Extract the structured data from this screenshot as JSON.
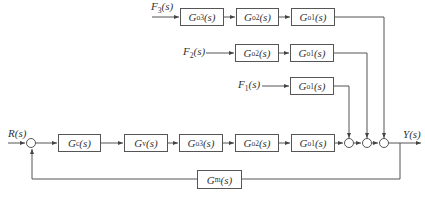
{
  "diagram": {
    "type": "control-block-diagram",
    "inputs": {
      "reference": "R(s)",
      "disturbances": [
        {
          "id": "F3",
          "label": "F3(s)"
        },
        {
          "id": "F2",
          "label": "F2(s)"
        },
        {
          "id": "F1",
          "label": "F1(s)"
        }
      ]
    },
    "output": "Y(s)",
    "blocks": {
      "row_f3": [
        {
          "base": "G",
          "sub": "o3",
          "tail": "(s)"
        },
        {
          "base": "G",
          "sub": "o2",
          "tail": "(s)"
        },
        {
          "base": "G",
          "sub": "o1",
          "tail": "(s)"
        }
      ],
      "row_f2": [
        {
          "base": "G",
          "sub": "o2",
          "tail": "(s)"
        },
        {
          "base": "G",
          "sub": "o1",
          "tail": "(s)"
        }
      ],
      "row_f1": [
        {
          "base": "G",
          "sub": "o1",
          "tail": "(s)"
        }
      ],
      "main": [
        {
          "base": "G",
          "sub": "c",
          "tail": "(s)"
        },
        {
          "base": "G",
          "sub": "v",
          "tail": "(s)"
        },
        {
          "base": "G",
          "sub": "o3",
          "tail": "(s)"
        },
        {
          "base": "G",
          "sub": "o2",
          "tail": "(s)"
        },
        {
          "base": "G",
          "sub": "o1",
          "tail": "(s)"
        }
      ],
      "feedback": {
        "base": "G",
        "sub": "m",
        "tail": "(s)"
      }
    },
    "labels": {
      "R": {
        "base": "R",
        "tail": "(s)"
      },
      "Y": {
        "base": "Y",
        "tail": "(s)"
      },
      "F3": {
        "base": "F",
        "sub": "3",
        "tail": "(s)"
      },
      "F2": {
        "base": "F",
        "sub": "2",
        "tail": "(s)"
      },
      "F1": {
        "base": "F",
        "sub": "1",
        "tail": "(s)"
      }
    },
    "summing_junctions": [
      "input-comparator",
      "sum-F1",
      "sum-F2",
      "sum-F3"
    ]
  }
}
